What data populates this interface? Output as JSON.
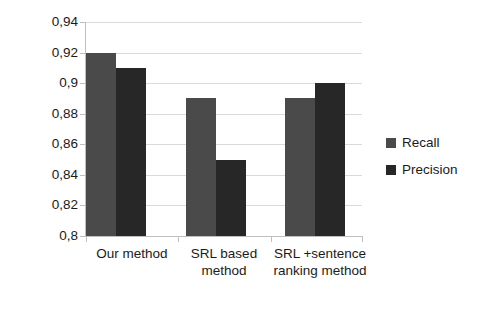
{
  "chart_data": {
    "type": "bar",
    "title": "",
    "xlabel": "",
    "ylabel": "",
    "ylim": [
      0.8,
      0.94
    ],
    "grid": true,
    "legend_position": "right",
    "categories": [
      "Our method",
      "SRL based method",
      "SRL +sentence ranking method"
    ],
    "series": [
      {
        "name": "Recall",
        "color": "#4a4a4a",
        "values": [
          0.92,
          0.89,
          0.89
        ]
      },
      {
        "name": "Precision",
        "color": "#272727",
        "values": [
          0.91,
          0.85,
          0.9
        ]
      }
    ],
    "y_tick_labels": [
      "0,94",
      "0,92",
      "0,9",
      "0,88",
      "0,86",
      "0,84",
      "0,82",
      "0,8"
    ],
    "y_tick_values": [
      0.94,
      0.92,
      0.9,
      0.88,
      0.86,
      0.84,
      0.82,
      0.8
    ],
    "decimal_separator": ","
  },
  "legend": {
    "items": [
      {
        "label": "Recall"
      },
      {
        "label": "Precision"
      }
    ]
  },
  "axes": {
    "grid_color": "#d9d9d9",
    "axis_color": "#bfbfbf"
  }
}
